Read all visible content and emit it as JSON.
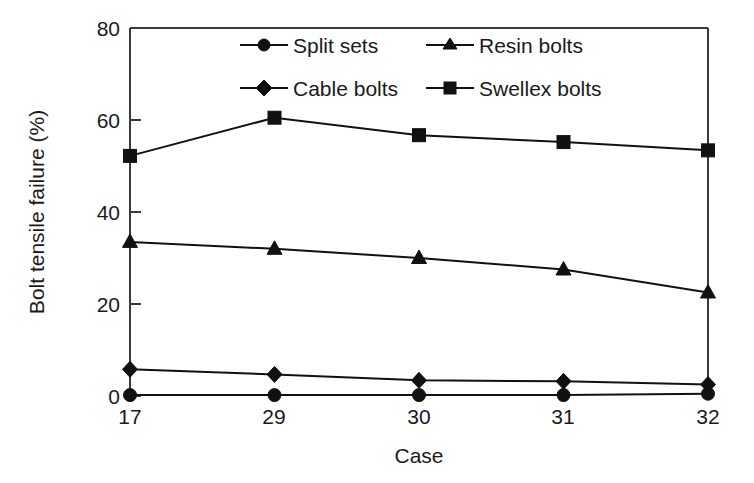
{
  "chart_data": {
    "type": "line",
    "title": "",
    "xlabel": "Case",
    "ylabel": "Bolt tensile failure (%)",
    "categories": [
      "17",
      "29",
      "30",
      "31",
      "32"
    ],
    "xtick_labels": [
      "17",
      "29",
      "30",
      "31",
      "32"
    ],
    "ytick_labels": [
      "0",
      "20",
      "40",
      "60",
      "80"
    ],
    "yticks": [
      0,
      20,
      40,
      60,
      80
    ],
    "ylim": [
      0,
      80
    ],
    "grid": false,
    "legend_position": "top-center-inside",
    "series": [
      {
        "name": "Split sets",
        "marker": "circle",
        "values": [
          0.2,
          0.2,
          0.2,
          0.2,
          0.5
        ]
      },
      {
        "name": "Resin bolts",
        "marker": "triangle",
        "values": [
          33.5,
          32.0,
          30.0,
          27.5,
          22.5
        ]
      },
      {
        "name": "Cable bolts",
        "marker": "diamond",
        "values": [
          5.8,
          4.7,
          3.4,
          3.2,
          2.5
        ]
      },
      {
        "name": "Swellex bolts",
        "marker": "square",
        "values": [
          52.2,
          60.5,
          56.7,
          55.2,
          53.4
        ]
      }
    ]
  },
  "axes": {
    "ylabel": "Bolt tensile failure (%)",
    "xlabel": "Case",
    "ytick_0": "0",
    "ytick_20": "20",
    "ytick_40": "40",
    "ytick_60": "60",
    "ytick_80": "80",
    "xtick_0": "17",
    "xtick_1": "29",
    "xtick_2": "30",
    "xtick_3": "31",
    "xtick_4": "32"
  },
  "legend": {
    "entries": [
      {
        "label": "Split sets",
        "marker": "circle"
      },
      {
        "label": "Resin bolts",
        "marker": "triangle"
      },
      {
        "label": "Cable bolts",
        "marker": "diamond"
      },
      {
        "label": "Swellex bolts",
        "marker": "square"
      }
    ]
  },
  "colors": {
    "line": "#111111",
    "marker": "#111111",
    "frame": "#3a3a3a",
    "text": "#1a1a1a",
    "background": "#ffffff"
  }
}
